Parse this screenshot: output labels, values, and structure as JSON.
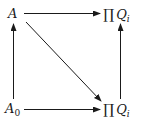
{
  "diagram": {
    "type": "commutative-square",
    "nodes": {
      "top_left": {
        "label": "A",
        "base": "A",
        "subscript": ""
      },
      "top_right": {
        "label": "∏ Q_i",
        "operator": "∏",
        "base": "Q",
        "subscript": "i"
      },
      "bottom_left": {
        "label": "A_0",
        "base": "A",
        "subscript": "0"
      },
      "bottom_right": {
        "label": "∏ Q_i",
        "operator": "∏",
        "base": "Q",
        "subscript": "i"
      }
    },
    "arrows": [
      {
        "from": "top_left",
        "to": "top_right",
        "direction": "right"
      },
      {
        "from": "bottom_left",
        "to": "top_left",
        "direction": "up"
      },
      {
        "from": "bottom_right",
        "to": "top_right",
        "direction": "up"
      },
      {
        "from": "top_left",
        "to": "bottom_right",
        "direction": "diagonal"
      },
      {
        "from": "bottom_left",
        "to": "bottom_right",
        "direction": "right"
      }
    ],
    "colors": {
      "ink": "#1a1a1a",
      "background": "#ffffff"
    }
  }
}
